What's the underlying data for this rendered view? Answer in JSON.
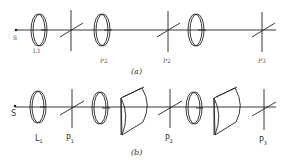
{
  "diagram": {
    "panel_a": {
      "caption": "(a)",
      "labels": {
        "source": "S",
        "lens1": "L1",
        "p1": "P2",
        "p2": "P2",
        "p3": "P3"
      },
      "components": [
        "source",
        "lens",
        "polarizer",
        "lens",
        "polarizer",
        "lens",
        "polarizer"
      ]
    },
    "panel_b": {
      "caption": "(b)",
      "labels": {
        "source": "S",
        "lens1": "L",
        "lens1_sub": "1",
        "p1": "P",
        "p1_sub": "1",
        "p2": "P",
        "p2_sub": "2",
        "p3": "P",
        "p3_sub": "3"
      },
      "components": [
        "source",
        "lens",
        "polarizer",
        "lens",
        "prism",
        "polarizer",
        "lens",
        "prism",
        "polarizer"
      ]
    }
  }
}
